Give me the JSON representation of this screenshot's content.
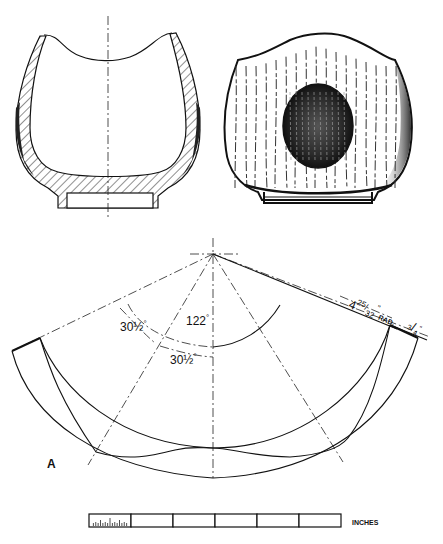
{
  "figure": {
    "section_view": {
      "label": "cross-section"
    },
    "exterior_view": {
      "label": "exterior-with-grain"
    },
    "template": {
      "label": "A",
      "dimensions": {
        "total_angle": "122",
        "total_angle_unit": "°",
        "segment_angle_1": "30",
        "segment_angle_1_frac": "½",
        "segment_angle_1_unit": "°",
        "segment_angle_2": "30",
        "segment_angle_2_frac": "½",
        "segment_angle_2_unit": "°",
        "radius_whole": "4",
        "radius_num": "25",
        "radius_den": "32",
        "radius_unit": "\"",
        "radius_suffix": "RAD.",
        "thickness_num": "3",
        "thickness_den": "4",
        "thickness_unit": "\""
      }
    },
    "scale_bar": {
      "label": "INCHES",
      "divisions": 6,
      "first_division_subdivided": true
    }
  }
}
